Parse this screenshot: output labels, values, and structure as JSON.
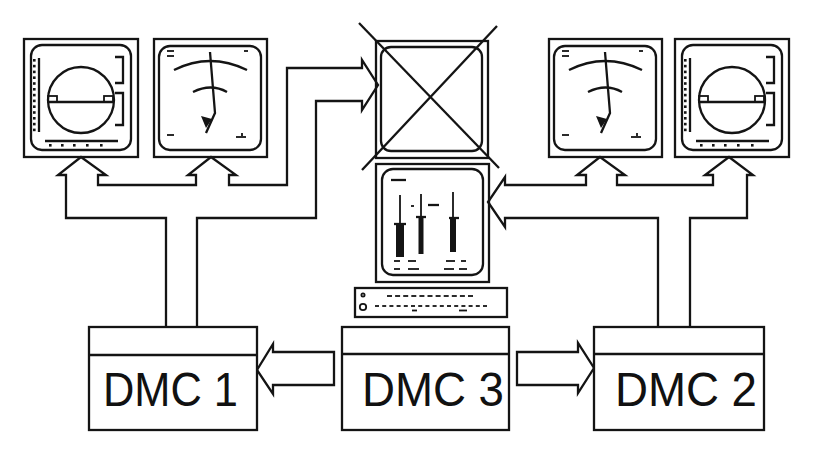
{
  "diagram": {
    "title": "",
    "colors": {
      "line": "#141414",
      "background": "#ffffff"
    },
    "controllers": [
      {
        "id": "dmc1",
        "label": "DMC 1"
      },
      {
        "id": "dmc3",
        "label": "DMC 3"
      },
      {
        "id": "dmc2",
        "label": "DMC 2"
      }
    ],
    "displays": [
      {
        "id": "left-attitude",
        "icon": "attitude-indicator-display-icon"
      },
      {
        "id": "left-gauge",
        "icon": "dial-gauge-display-icon"
      },
      {
        "id": "center-failed",
        "icon": "crossed-out-display-icon"
      },
      {
        "id": "center-engine",
        "icon": "bar-gauge-display-icon"
      },
      {
        "id": "right-gauge",
        "icon": "dial-gauge-display-icon"
      },
      {
        "id": "right-attitude",
        "icon": "attitude-indicator-display-icon"
      }
    ],
    "peripherals": [
      {
        "id": "control-panel",
        "icon": "keyboard-control-panel-icon"
      }
    ],
    "connections": [
      {
        "from": "DMC 1",
        "to": [
          "left-attitude",
          "left-gauge",
          "center-failed"
        ]
      },
      {
        "from": "DMC 2",
        "to": [
          "right-gauge",
          "right-attitude",
          "center-engine"
        ]
      },
      {
        "from": "DMC 3",
        "to": [
          "DMC 1",
          "DMC 2"
        ]
      }
    ]
  }
}
